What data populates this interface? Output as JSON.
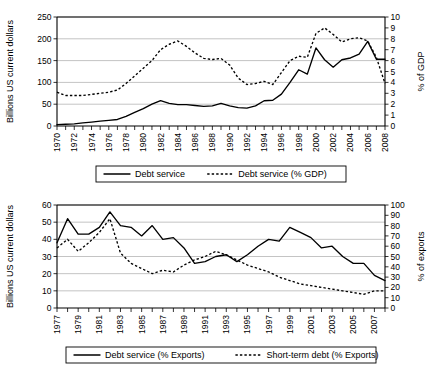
{
  "chart_data": [
    {
      "id": "chart-debt-service-gdp",
      "type": "line",
      "title": "",
      "xlabel": "",
      "ylabel": "Billions US current dollars",
      "y2label": "% of GDP",
      "ylim": [
        0,
        250
      ],
      "yticks": [
        0,
        50,
        100,
        150,
        200,
        250
      ],
      "y2lim": [
        0,
        10
      ],
      "y2ticks": [
        0,
        1,
        2,
        3,
        4,
        5,
        6,
        7,
        8,
        9,
        10
      ],
      "grid": true,
      "legend_position": "bottom",
      "x": [
        1970,
        1971,
        1972,
        1973,
        1974,
        1975,
        1976,
        1977,
        1978,
        1979,
        1980,
        1981,
        1982,
        1983,
        1984,
        1985,
        1986,
        1987,
        1988,
        1989,
        1990,
        1991,
        1992,
        1993,
        1994,
        1995,
        1996,
        1997,
        1998,
        1999,
        2000,
        2001,
        2002,
        2003,
        2004,
        2005,
        2006,
        2007,
        2008
      ],
      "xtick_labels": [
        "1970",
        "1972",
        "1974",
        "1976",
        "1978",
        "1980",
        "1982",
        "1984",
        "1986",
        "1988",
        "1990",
        "1992",
        "1994",
        "1996",
        "1998",
        "2000",
        "2002",
        "2004",
        "2006",
        "2008"
      ],
      "xlim": [
        1970,
        2008
      ],
      "series": [
        {
          "name": "Debt service",
          "style": "solid",
          "axis": "left",
          "units": "Billions US current dollars",
          "values": [
            3,
            4,
            5,
            7,
            9,
            11,
            13,
            15,
            22,
            31,
            40,
            50,
            58,
            52,
            49,
            49,
            47,
            45,
            46,
            52,
            46,
            42,
            41,
            46,
            58,
            59,
            73,
            100,
            129,
            119,
            179,
            152,
            135,
            152,
            156,
            165,
            194,
            153,
            153
          ]
        },
        {
          "name": "Debt service (% GDP)",
          "style": "dashed",
          "axis": "right",
          "units": "% of GDP",
          "values": [
            3.1,
            2.8,
            2.8,
            2.8,
            2.9,
            3.0,
            3.1,
            3.3,
            3.9,
            4.6,
            5.3,
            6.0,
            7.0,
            7.5,
            7.8,
            7.3,
            6.7,
            6.2,
            6.1,
            6.2,
            5.6,
            4.4,
            3.8,
            3.9,
            4.1,
            3.8,
            4.9,
            6.0,
            6.4,
            6.3,
            8.5,
            9.0,
            8.4,
            7.7,
            8.0,
            8.1,
            7.8,
            6.3,
            3.9
          ]
        }
      ],
      "legend": [
        {
          "label": "Debt service",
          "style": "solid"
        },
        {
          "label": "Debt service (% GDP)",
          "style": "dashed"
        }
      ]
    },
    {
      "id": "chart-debt-service-exports",
      "type": "line",
      "title": "",
      "xlabel": "",
      "ylabel": "Billions US current dollars",
      "y2label": "% of exports",
      "ylim": [
        0,
        60
      ],
      "yticks": [
        0,
        10,
        20,
        30,
        40,
        50,
        60
      ],
      "y2lim": [
        0,
        100
      ],
      "y2ticks": [
        0,
        10,
        20,
        30,
        40,
        50,
        60,
        70,
        80,
        90,
        100
      ],
      "grid": true,
      "legend_position": "bottom",
      "x": [
        1977,
        1978,
        1979,
        1980,
        1981,
        1982,
        1983,
        1984,
        1985,
        1986,
        1987,
        1988,
        1989,
        1990,
        1991,
        1992,
        1993,
        1994,
        1995,
        1996,
        1997,
        1998,
        1999,
        2000,
        2001,
        2002,
        2003,
        2004,
        2005,
        2006,
        2007,
        2008
      ],
      "xtick_labels": [
        "1977",
        "1979",
        "1981",
        "1983",
        "1985",
        "1987",
        "1989",
        "1991",
        "1993",
        "1995",
        "1997",
        "1999",
        "2001",
        "2003",
        "2005",
        "2007"
      ],
      "xlim": [
        1977,
        2008
      ],
      "series": [
        {
          "name": "Debt service (% Exports)",
          "style": "solid",
          "axis": "left",
          "units": "% of exports",
          "values": [
            38,
            52,
            43,
            43,
            47,
            56,
            48,
            47,
            42,
            48,
            40,
            41,
            35,
            26,
            27,
            30,
            31,
            27,
            31,
            36,
            40,
            39,
            47,
            44,
            41,
            35,
            36,
            30,
            26,
            26,
            19,
            16
          ]
        },
        {
          "name": "Short-term debt (% Exports)",
          "style": "dashed",
          "axis": "left",
          "units": "% of exports",
          "values": [
            35,
            40,
            33,
            38,
            44,
            52,
            32,
            26,
            23,
            20,
            22,
            21,
            25,
            28,
            30,
            33,
            31,
            28,
            25,
            23,
            21,
            18,
            16,
            14,
            13,
            12,
            11,
            10,
            9,
            8,
            10,
            10
          ]
        }
      ],
      "legend": [
        {
          "label": "Debt service (% Exports)",
          "style": "solid"
        },
        {
          "label": "Short-term debt (% Exports)",
          "style": "dashed"
        }
      ]
    }
  ],
  "figure1": {
    "ylabel": "Billions US current dollars",
    "y2label": "% of GDP",
    "legend": {
      "item1": "Debt service",
      "item2": "Debt service (% GDP)"
    }
  },
  "figure2": {
    "ylabel": "Billions US current dollars",
    "y2label": "% of exports",
    "legend": {
      "item1": "Debt service (% Exports)",
      "item2": "Short-term debt (% Exports)"
    }
  }
}
